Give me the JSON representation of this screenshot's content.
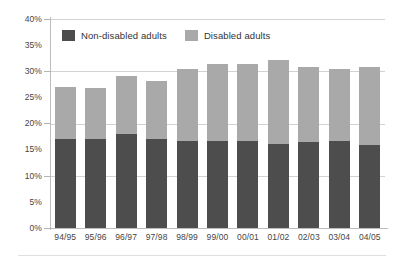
{
  "legend": {
    "items": [
      {
        "label": "Non-disabled adults",
        "color": "#4d4d4d",
        "swatch": "dark"
      },
      {
        "label": "Disabled adults",
        "color": "#a9a9a9",
        "swatch": "light"
      }
    ]
  },
  "axis": {
    "y_ticks": [
      "0%",
      "5%",
      "10%",
      "15%",
      "20%",
      "25%",
      "30%",
      "35%",
      "40%"
    ],
    "x_ticks": [
      "94/95",
      "95/96",
      "96/97",
      "97/98",
      "98/99",
      "99/00",
      "00/01",
      "01/02",
      "02/03",
      "03/04",
      "04/05"
    ]
  },
  "chart_data": {
    "type": "bar",
    "stacked": true,
    "title": "",
    "subtitle": "",
    "xlabel": "",
    "ylabel": "",
    "ylim": [
      0,
      40
    ],
    "ytick_step": 5,
    "ytick_format": "percent",
    "grid": true,
    "legend_position": "top-inside",
    "categories": [
      "94/95",
      "95/96",
      "96/97",
      "97/98",
      "98/99",
      "99/00",
      "00/01",
      "01/02",
      "02/03",
      "03/04",
      "04/05"
    ],
    "series": [
      {
        "name": "Non-disabled adults",
        "color": "#4d4d4d",
        "values": [
          17.0,
          17.0,
          18.0,
          17.1,
          16.6,
          16.6,
          16.6,
          16.0,
          16.5,
          16.6,
          15.8
        ]
      },
      {
        "name": "Disabled adults",
        "color": "#a9a9a9",
        "values": [
          9.9,
          9.8,
          11.0,
          11.1,
          13.9,
          14.7,
          14.7,
          16.2,
          14.4,
          13.9,
          15.1
        ]
      }
    ],
    "totals": [
      26.9,
      26.8,
      29.0,
      28.2,
      30.5,
      31.3,
      31.3,
      32.2,
      30.9,
      30.5,
      30.9
    ]
  }
}
